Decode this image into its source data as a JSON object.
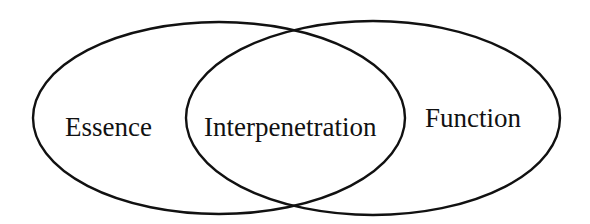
{
  "diagram": {
    "type": "venn",
    "sets": [
      {
        "label": "Essence"
      },
      {
        "label": "Function"
      }
    ],
    "intersection": {
      "label": "Interpenetration"
    },
    "colors": {
      "stroke": "#111111",
      "background": "#ffffff"
    }
  }
}
